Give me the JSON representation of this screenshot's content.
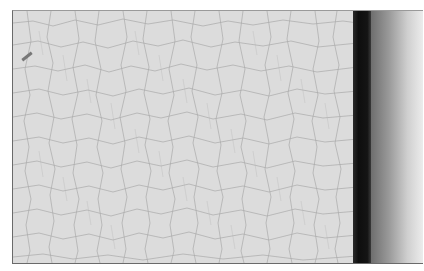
{
  "image": {
    "description": "Close-up photograph of white cracked (craquelure) paint surface with a dark torn edge and gray gradient on the right side",
    "colors": {
      "paint": "#dcdcdc",
      "cracks": "#9c9c9c",
      "edge": "#111111",
      "gradient_start": "#6e6e6e",
      "gradient_end": "#ececec"
    }
  }
}
